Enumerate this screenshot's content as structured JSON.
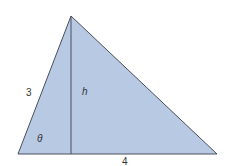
{
  "diagram": {
    "fill_color": "#b8c9e3",
    "stroke_color": "#4a4f5c",
    "labels": {
      "left_side": "3",
      "height": "h",
      "angle": "θ",
      "base": "4"
    }
  }
}
